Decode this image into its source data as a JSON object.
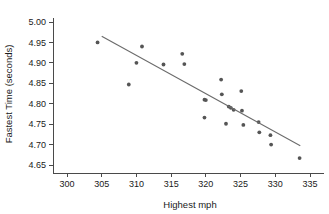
{
  "chart_data": {
    "type": "scatter",
    "title": "",
    "xlabel": "Highest mph",
    "ylabel": "Fastest Time (seconds)",
    "xlim": [
      298,
      337
    ],
    "ylim": [
      4.63,
      5.01
    ],
    "xticks": [
      300,
      305,
      310,
      315,
      320,
      325,
      330,
      335
    ],
    "xtick_labels": [
      "300",
      "305",
      "310",
      "315",
      "320",
      "325",
      "330",
      "335"
    ],
    "yticks": [
      4.65,
      4.7,
      4.75,
      4.8,
      4.85,
      4.9,
      4.95,
      5.0
    ],
    "ytick_labels": [
      "4.65",
      "4.70",
      "4.75",
      "4.80",
      "4.85",
      "4.90",
      "4.95",
      "5.00"
    ],
    "grid": false,
    "legend": false,
    "marker_color": "#555555",
    "line_color": "#6b6b6b",
    "axis_color": "#4a4a4a",
    "points": [
      {
        "x": 304.4,
        "y": 4.95
      },
      {
        "x": 308.9,
        "y": 4.847
      },
      {
        "x": 310.0,
        "y": 4.9
      },
      {
        "x": 310.8,
        "y": 4.94
      },
      {
        "x": 313.9,
        "y": 4.896
      },
      {
        "x": 316.6,
        "y": 4.922
      },
      {
        "x": 316.9,
        "y": 4.897
      },
      {
        "x": 319.8,
        "y": 4.81
      },
      {
        "x": 320.0,
        "y": 4.809
      },
      {
        "x": 319.8,
        "y": 4.766
      },
      {
        "x": 322.2,
        "y": 4.859
      },
      {
        "x": 322.3,
        "y": 4.823
      },
      {
        "x": 322.9,
        "y": 4.751
      },
      {
        "x": 323.3,
        "y": 4.793
      },
      {
        "x": 323.6,
        "y": 4.79
      },
      {
        "x": 324.0,
        "y": 4.785
      },
      {
        "x": 325.1,
        "y": 4.831
      },
      {
        "x": 325.2,
        "y": 4.783
      },
      {
        "x": 325.4,
        "y": 4.748
      },
      {
        "x": 327.6,
        "y": 4.755
      },
      {
        "x": 327.7,
        "y": 4.73
      },
      {
        "x": 329.3,
        "y": 4.723
      },
      {
        "x": 329.4,
        "y": 4.7
      },
      {
        "x": 333.5,
        "y": 4.667
      }
    ],
    "trend_line": {
      "x_start": 305.0,
      "y_start": 4.965,
      "x_end": 333.6,
      "y_end": 4.697
    }
  }
}
